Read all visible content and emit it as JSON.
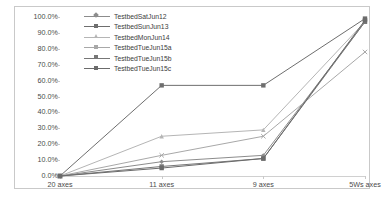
{
  "chart_data": {
    "type": "line",
    "title": "",
    "subtitle": "",
    "xlabel": "",
    "ylabel": "",
    "categories": [
      "20 axes",
      "11 axes",
      "9 axes",
      "5Ws axes"
    ],
    "ylim": [
      0,
      100
    ],
    "y_tick_labels": [
      "100.0%",
      "90.0%",
      "80.0%",
      "70.0%",
      "60.0%",
      "50.0%",
      "40.0%",
      "30.0%",
      "20.0%",
      "10.0%",
      "0.0%"
    ],
    "y_tick_values": [
      100,
      90,
      80,
      70,
      60,
      50,
      40,
      30,
      20,
      10,
      0
    ],
    "grid": false,
    "legend_position": "top-left-inside",
    "series": [
      {
        "name": "TestbedSatJun12",
        "color": "#8c8c8c",
        "marker": "diamond",
        "values": [
          0,
          9,
          13,
          97
        ]
      },
      {
        "name": "TestbedSunJun13",
        "color": "#6e6e6e",
        "marker": "square",
        "values": [
          0,
          57,
          57,
          99
        ]
      },
      {
        "name": "TestbedMonJun14",
        "color": "#b5b5b5",
        "marker": "triangle",
        "values": [
          0,
          25,
          29,
          97
        ]
      },
      {
        "name": "TestbedTueJun15a",
        "color": "#a8a8a8",
        "marker": "cross",
        "values": [
          0,
          13,
          25,
          78
        ]
      },
      {
        "name": "TestbedTueJun15b",
        "color": "#777777",
        "marker": "square",
        "values": [
          0,
          6,
          11,
          97
        ]
      },
      {
        "name": "TestbedTueJun15c",
        "color": "#6b6b6b",
        "marker": "square",
        "values": [
          0,
          5,
          11,
          98
        ]
      }
    ]
  },
  "legend": {
    "items": [
      {
        "label": "TestbedSatJun12"
      },
      {
        "label": "TestbedSunJun13"
      },
      {
        "label": "TestbedMonJun14"
      },
      {
        "label": "TestbedTueJun15a"
      },
      {
        "label": "TestbedTueJun15b"
      },
      {
        "label": "TestbedTueJun15c"
      }
    ]
  },
  "colors": {
    "border": "#c9c9c9",
    "axis": "#d0d0d0",
    "text": "#4a4a4a",
    "background": "#ffffff"
  }
}
